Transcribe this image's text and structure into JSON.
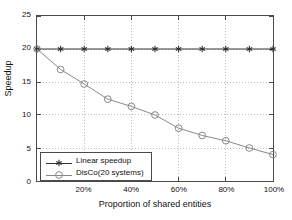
{
  "chart_data": {
    "type": "line",
    "title": "",
    "xlabel": "Proportion of shared entities",
    "ylabel": "Speedup",
    "x": [
      0,
      10,
      20,
      30,
      40,
      50,
      60,
      70,
      80,
      90,
      100
    ],
    "xtick_labels": [
      "20%",
      "40%",
      "60%",
      "80%",
      "100%"
    ],
    "xtick_values": [
      20,
      40,
      60,
      80,
      100
    ],
    "ytick_labels": [
      "0",
      "5",
      "10",
      "15",
      "20",
      "25"
    ],
    "ytick_values": [
      0,
      5,
      10,
      15,
      20,
      25
    ],
    "xlim": [
      0,
      100
    ],
    "ylim": [
      0,
      25
    ],
    "grid": true,
    "legend_position": "lower-left",
    "series": [
      {
        "name": "Linear speedup",
        "marker": "asterisk",
        "color": "#333333",
        "values": [
          20,
          20,
          20,
          20,
          20,
          20,
          20,
          20,
          20,
          20,
          20
        ]
      },
      {
        "name": "DisCo(20 systems)",
        "marker": "circle",
        "color": "#888888",
        "values": [
          20,
          16.9,
          14.7,
          12.4,
          11.3,
          10.0,
          8.0,
          6.9,
          6.1,
          5.0,
          4.0
        ]
      }
    ]
  },
  "legend": {
    "items": [
      {
        "label": "Linear speedup",
        "marker": "asterisk"
      },
      {
        "label": "DisCo(20 systems)",
        "marker": "circle"
      }
    ]
  },
  "colors": {
    "axis": "#4a4a4a",
    "grid": "#bdbdbd",
    "linear_series": "#333333",
    "disco_series": "#888888",
    "background": "#ffffff"
  }
}
